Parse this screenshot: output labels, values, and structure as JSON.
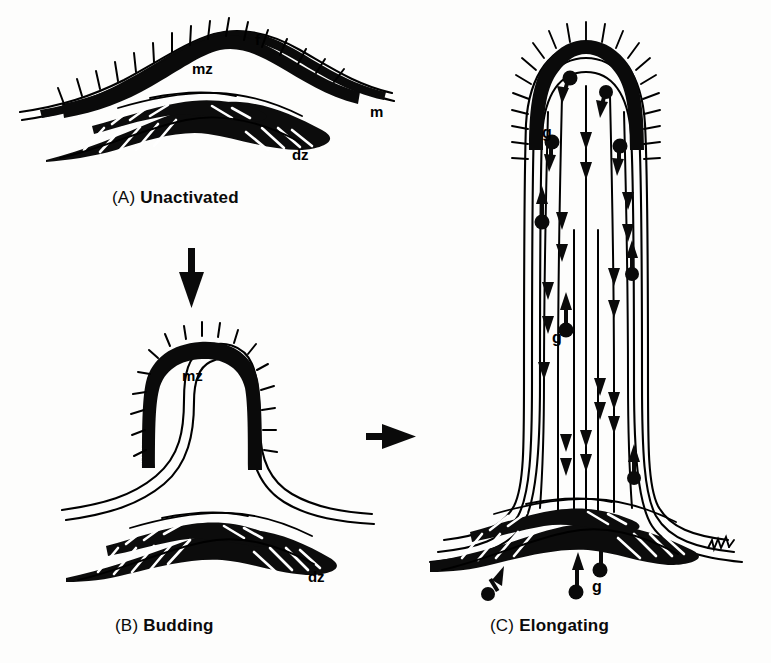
{
  "figure": {
    "background_color": "#fdfdfc",
    "ink_color": "#000000",
    "width": 771,
    "height": 663
  },
  "panels": [
    {
      "id": "A",
      "prefix": "(A)",
      "caption": "Unactivated",
      "caption_x": 112,
      "caption_y": 188,
      "labels": [
        {
          "text": "f",
          "name": "label-f-fibrils",
          "x": 255,
          "y": 31,
          "size": 15
        },
        {
          "text": "mz",
          "name": "label-mz-meristematic-zone",
          "x": 192,
          "y": 60,
          "size": 15
        },
        {
          "text": "m",
          "name": "label-m-membrane",
          "x": 370,
          "y": 103,
          "size": 15
        },
        {
          "text": "dz",
          "name": "label-dz-differentiation-zone",
          "x": 292,
          "y": 146,
          "size": 15
        }
      ]
    },
    {
      "id": "B",
      "prefix": "(B)",
      "caption": "Budding",
      "caption_x": 115,
      "caption_y": 616,
      "labels": [
        {
          "text": "mz",
          "name": "label-mz-meristematic-zone",
          "x": 182,
          "y": 367,
          "size": 15
        },
        {
          "text": "dz",
          "name": "label-dz-differentiation-zone",
          "x": 308,
          "y": 568,
          "size": 15
        }
      ]
    },
    {
      "id": "C",
      "prefix": "(C)",
      "caption": "Elongating",
      "caption_x": 490,
      "caption_y": 616,
      "labels": [
        {
          "text": "g",
          "name": "label-g-granule-apical",
          "x": 542,
          "y": 124,
          "size": 16
        },
        {
          "text": "g",
          "name": "label-g-granule-shaft",
          "x": 552,
          "y": 329,
          "size": 16
        },
        {
          "text": "g",
          "name": "label-g-granule-base",
          "x": 592,
          "y": 578,
          "size": 16
        }
      ]
    }
  ],
  "transitions": [
    {
      "name": "arrow-a-to-b",
      "direction": "down",
      "from": "A",
      "to": "B",
      "x1": 192,
      "y1": 248,
      "x2": 192,
      "y2": 306
    },
    {
      "name": "arrow-b-to-c",
      "direction": "right",
      "from": "B",
      "to": "C",
      "x1": 366,
      "y1": 436,
      "x2": 414,
      "y2": 436
    }
  ],
  "legend_keys": [
    {
      "key": "f",
      "meaning": "fibrils"
    },
    {
      "key": "m",
      "meaning": "membrane"
    },
    {
      "key": "mz",
      "meaning": "meristematic zone"
    },
    {
      "key": "dz",
      "meaning": "differentiation zone"
    },
    {
      "key": "g",
      "meaning": "granule"
    }
  ],
  "artist_mark": {
    "name": "artist-signature",
    "x": 712,
    "y": 543,
    "text": ""
  }
}
